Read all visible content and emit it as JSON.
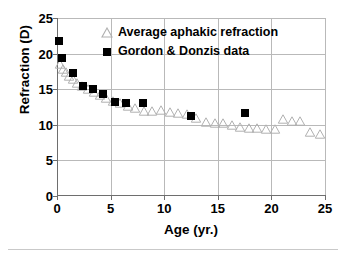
{
  "chart_data": {
    "type": "scatter",
    "title": "",
    "xlabel": "Age (yr.)",
    "ylabel": "Refraction (D)",
    "xlim": [
      0,
      25
    ],
    "ylim": [
      0,
      25
    ],
    "xticks": [
      0,
      5,
      10,
      15,
      20,
      25
    ],
    "yticks": [
      0,
      5,
      10,
      15,
      20,
      25
    ],
    "grid": true,
    "legend_position": "top-center-inside",
    "series": [
      {
        "name": "Average aphakic refraction",
        "marker": "open-triangle",
        "color": "#b0b0b0",
        "points": [
          [
            0.3,
            18.5
          ],
          [
            0.55,
            17.9
          ],
          [
            0.8,
            17.4
          ],
          [
            1.1,
            16.9
          ],
          [
            1.45,
            16.4
          ],
          [
            1.85,
            15.9
          ],
          [
            2.35,
            15.4
          ],
          [
            2.9,
            15.0
          ],
          [
            3.45,
            14.6
          ],
          [
            4.0,
            14.2
          ],
          [
            4.6,
            13.8
          ],
          [
            5.2,
            13.3
          ],
          [
            5.9,
            13.0
          ],
          [
            6.6,
            12.7
          ],
          [
            7.3,
            12.4
          ],
          [
            8.1,
            12.0
          ],
          [
            8.9,
            12.0
          ],
          [
            9.7,
            12.1
          ],
          [
            10.5,
            11.8
          ],
          [
            11.3,
            11.7
          ],
          [
            12.1,
            11.5
          ],
          [
            13.0,
            10.9
          ],
          [
            13.9,
            10.4
          ],
          [
            14.7,
            10.2
          ],
          [
            15.5,
            10.3
          ],
          [
            16.3,
            10.0
          ],
          [
            17.1,
            9.7
          ],
          [
            17.9,
            9.5
          ],
          [
            18.7,
            9.5
          ],
          [
            19.5,
            9.4
          ],
          [
            20.3,
            9.4
          ],
          [
            21.1,
            10.8
          ],
          [
            21.9,
            10.6
          ],
          [
            22.7,
            10.5
          ],
          [
            23.6,
            9.0
          ],
          [
            24.5,
            8.7
          ]
        ]
      },
      {
        "name": "Gordon & Donzis data",
        "marker": "filled-square",
        "color": "#000000",
        "points": [
          [
            0.2,
            21.7
          ],
          [
            0.5,
            19.4
          ],
          [
            1.5,
            17.3
          ],
          [
            2.4,
            15.4
          ],
          [
            3.4,
            15.0
          ],
          [
            4.3,
            14.3
          ],
          [
            5.4,
            13.2
          ],
          [
            6.4,
            13.0
          ],
          [
            8.0,
            13.0
          ],
          [
            12.5,
            11.3
          ],
          [
            17.5,
            11.7
          ]
        ]
      }
    ]
  },
  "legend": {
    "items": [
      {
        "label": "Average aphakic refraction",
        "marker": "open-triangle"
      },
      {
        "label": "Gordon & Donzis data",
        "marker": "filled-square"
      }
    ]
  },
  "axes": {
    "y_title": "Refraction (D)",
    "x_title": "Age (yr.)",
    "y_tick_labels": [
      "25",
      "20",
      "15",
      "10",
      "5",
      "0"
    ],
    "x_tick_labels": [
      "0",
      "5",
      "10",
      "15",
      "20",
      "25"
    ]
  },
  "colors": {
    "series_gordon": "#000000",
    "series_average": "#b0b0b0",
    "grid": "#b9b9b9",
    "axis": "#6e6e6e",
    "text": "#000000",
    "background": "#ffffff"
  }
}
